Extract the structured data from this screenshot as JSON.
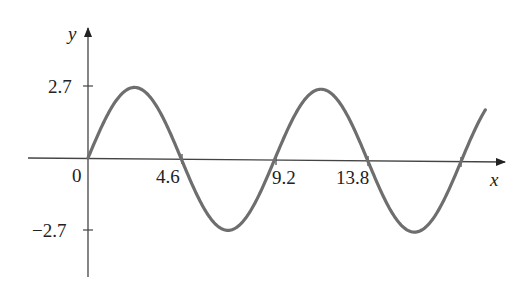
{
  "chart_data": {
    "type": "line",
    "title": "",
    "xlabel": "x",
    "ylabel": "y",
    "function": "y = 2.7 sin(2πx/9.2)",
    "amplitude": 2.7,
    "period": 9.2,
    "x_ticks": [
      "0",
      "4.6",
      "9.2",
      "13.8"
    ],
    "x_tick_values": [
      0,
      4.6,
      9.2,
      13.8
    ],
    "y_ticks": [
      "2.7",
      "−2.7"
    ],
    "y_tick_values": [
      2.7,
      -2.7
    ],
    "xlim": [
      0,
      18.9
    ],
    "ylim": [
      -2.7,
      2.7
    ],
    "grid": false,
    "series": [
      {
        "name": "sine curve",
        "x": [
          0,
          2.3,
          4.6,
          6.9,
          9.2,
          11.5,
          13.8,
          16.1,
          18.4,
          19.6
        ],
        "values": [
          0,
          2.7,
          0,
          -2.7,
          0,
          2.7,
          0,
          -2.7,
          0,
          1.3
        ]
      }
    ],
    "color": "#6e6e6e"
  },
  "labels": {
    "x_axis": "x",
    "y_axis": "y",
    "origin": "0",
    "x_tick_1": "4.6",
    "x_tick_2": "9.2",
    "x_tick_3": "13.8",
    "y_tick_pos": "2.7",
    "y_tick_neg": "−2.7"
  }
}
